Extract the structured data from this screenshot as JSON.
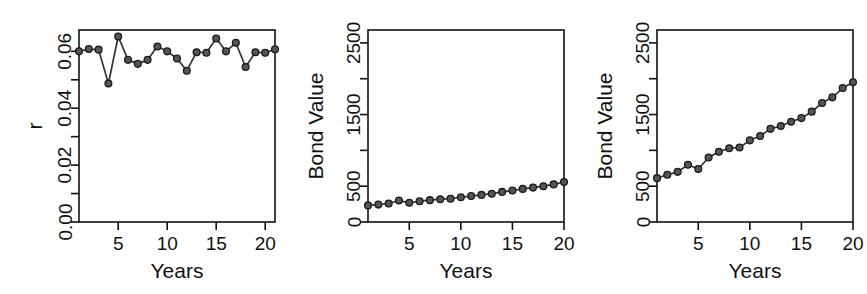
{
  "figure": {
    "background": "#ffffff",
    "ink": "#111111",
    "marker_fill": "#555555",
    "marker_stroke": "#1a1a1a",
    "line_color": "#333333",
    "panel_count": 3
  },
  "chart_data": [
    {
      "type": "line",
      "title": "",
      "xlabel": "Years",
      "ylabel": "r",
      "xlim": [
        1,
        21
      ],
      "ylim": [
        0.0,
        0.0675
      ],
      "grid": false,
      "legend": "none",
      "xticks": [
        5,
        10,
        15,
        20
      ],
      "xticklabels": [
        "5",
        "10",
        "15",
        "20"
      ],
      "yticks": [
        0.0,
        0.01,
        0.02,
        0.03,
        0.04,
        0.05,
        0.06
      ],
      "yticklabels": [
        "0.00",
        "",
        "0.02",
        "",
        "0.04",
        "",
        "0.06"
      ],
      "marker": "filled-circle",
      "x": [
        1,
        2,
        3,
        4,
        5,
        6,
        7,
        8,
        9,
        10,
        11,
        12,
        13,
        14,
        15,
        16,
        17,
        18,
        19,
        20,
        21
      ],
      "values": [
        0.06,
        0.0608,
        0.0606,
        0.0487,
        0.0652,
        0.057,
        0.0556,
        0.057,
        0.0617,
        0.06,
        0.0575,
        0.0532,
        0.0597,
        0.0595,
        0.0645,
        0.06,
        0.063,
        0.0545,
        0.0597,
        0.0595,
        0.0607
      ]
    },
    {
      "type": "line",
      "title": "",
      "xlabel": "Years",
      "ylabel": "Bond Value",
      "xlim": [
        1,
        20
      ],
      "ylim": [
        0,
        2680
      ],
      "grid": false,
      "legend": "none",
      "xticks": [
        5,
        10,
        15,
        20
      ],
      "xticklabels": [
        "5",
        "10",
        "15",
        "20"
      ],
      "yticks": [
        0,
        500,
        1000,
        1500,
        2000,
        2500
      ],
      "yticklabels": [
        "0",
        "500",
        "",
        "1500",
        "",
        "2500"
      ],
      "marker": "filled-circle",
      "x": [
        1,
        2,
        3,
        4,
        5,
        6,
        7,
        8,
        9,
        10,
        11,
        12,
        13,
        14,
        15,
        16,
        17,
        18,
        19,
        20
      ],
      "values": [
        232,
        243,
        258,
        300,
        268,
        290,
        305,
        318,
        325,
        345,
        362,
        378,
        395,
        420,
        440,
        462,
        480,
        500,
        525,
        557
      ]
    },
    {
      "type": "line",
      "title": "",
      "xlabel": "Years",
      "ylabel": "Bond Value",
      "xlim": [
        1,
        20
      ],
      "ylim": [
        0,
        2680
      ],
      "grid": false,
      "legend": "none",
      "xticks": [
        5,
        10,
        15,
        20
      ],
      "xticklabels": [
        "5",
        "10",
        "15",
        "20"
      ],
      "yticks": [
        0,
        500,
        1000,
        1500,
        2000,
        2500
      ],
      "yticklabels": [
        "0",
        "500",
        "",
        "1500",
        "",
        "2500"
      ],
      "marker": "filled-circle",
      "x": [
        1,
        2,
        3,
        4,
        5,
        6,
        7,
        8,
        9,
        10,
        11,
        12,
        13,
        14,
        15,
        16,
        17,
        18,
        19,
        20
      ],
      "values": [
        612,
        660,
        700,
        800,
        740,
        900,
        980,
        1030,
        1040,
        1140,
        1200,
        1300,
        1340,
        1400,
        1450,
        1540,
        1660,
        1740,
        1870,
        1950
      ]
    }
  ]
}
